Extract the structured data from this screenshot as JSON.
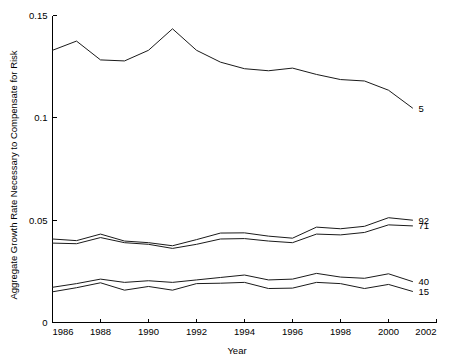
{
  "chart_data": {
    "type": "line",
    "title": "",
    "xlabel": "Year",
    "ylabel": "Aggregate Growth Rate Necessary to Compensate for Risk",
    "xlim": [
      1986,
      2002
    ],
    "ylim": [
      0,
      0.15
    ],
    "xticks": [
      1986,
      1988,
      1990,
      1992,
      1994,
      1996,
      1998,
      2000,
      2002
    ],
    "xticklabels": [
      "1986",
      "1988",
      "1990",
      "1992",
      "1994",
      "1996",
      "1998",
      "2000",
      "2002"
    ],
    "yticks": [
      0,
      0.05,
      0.1,
      0.15
    ],
    "yticklabels": [
      "0",
      "0.05",
      "0.1",
      "0.15"
    ],
    "grid": false,
    "legend_position": "right-end-labels",
    "x": [
      1986,
      1987,
      1988,
      1989,
      1990,
      1991,
      1992,
      1993,
      1994,
      1995,
      1996,
      1997,
      1998,
      1999,
      2000,
      2001
    ],
    "series": [
      {
        "name": "5",
        "label": "5",
        "values": [
          0.133,
          0.1375,
          0.1283,
          0.1278,
          0.133,
          0.1435,
          0.133,
          0.1272,
          0.124,
          0.123,
          0.1243,
          0.1212,
          0.1187,
          0.118,
          0.1135,
          0.1048
        ]
      },
      {
        "name": "92",
        "label": "92",
        "values": [
          0.0408,
          0.04,
          0.0432,
          0.0398,
          0.039,
          0.0375,
          0.0405,
          0.0437,
          0.0438,
          0.0422,
          0.0412,
          0.0466,
          0.0458,
          0.047,
          0.0512,
          0.05
        ]
      },
      {
        "name": "71",
        "label": "71",
        "values": [
          0.0388,
          0.0385,
          0.0415,
          0.039,
          0.0382,
          0.0362,
          0.0382,
          0.0408,
          0.041,
          0.0398,
          0.039,
          0.0432,
          0.0428,
          0.044,
          0.0477,
          0.0472
        ]
      },
      {
        "name": "40",
        "label": "40",
        "values": [
          0.0172,
          0.019,
          0.0212,
          0.0196,
          0.0204,
          0.0196,
          0.0208,
          0.022,
          0.0232,
          0.0208,
          0.0212,
          0.024,
          0.0222,
          0.0216,
          0.0238,
          0.02
        ]
      },
      {
        "name": "15",
        "label": "15",
        "values": [
          0.015,
          0.017,
          0.0194,
          0.0158,
          0.0176,
          0.0158,
          0.019,
          0.0192,
          0.0196,
          0.0166,
          0.0168,
          0.0196,
          0.019,
          0.0166,
          0.0186,
          0.0152
        ]
      }
    ]
  },
  "axis": {
    "x_title": "Year",
    "y_title": "Aggregate Growth Rate Necessary to Compensate for Risk"
  }
}
